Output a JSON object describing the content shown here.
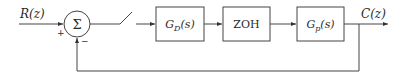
{
  "diagram": {
    "type": "block-diagram",
    "input_label": "R(z)",
    "output_label": "C(z)",
    "summing_junction": {
      "symbol": "Σ",
      "plus_sign": "+",
      "minus_sign": "−"
    },
    "blocks": [
      {
        "id": "controller",
        "main": "G",
        "sub": "D",
        "arg": "(s)"
      },
      {
        "id": "zoh",
        "label": "ZOH"
      },
      {
        "id": "plant",
        "main": "G",
        "sub": "p",
        "arg": "(s)"
      }
    ],
    "sampler": "switch",
    "feedback": "unity negative feedback from C(z) to summing junction"
  }
}
